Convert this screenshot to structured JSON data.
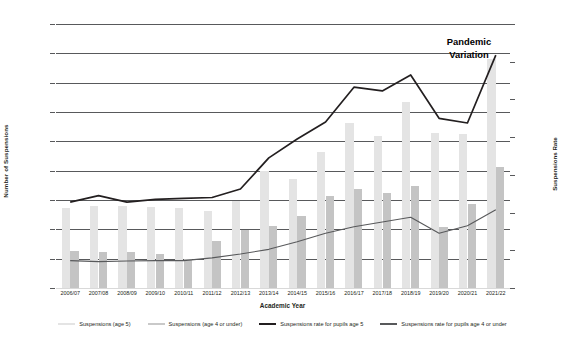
{
  "chart_data": {
    "type": "bar",
    "title": "",
    "xlabel": "Academic Year",
    "ylabel": "Number of Suspensions",
    "ylabel_secondary": "Suspensions Rate",
    "ylim": [
      0,
      9000
    ],
    "ylim_secondary": [
      0.0,
      1.4
    ],
    "ytick_labels": [
      "0",
      "1000",
      "2000",
      "3000",
      "4000",
      "5000",
      "6000",
      "7000",
      "8000",
      "9000"
    ],
    "ytick_values": [
      0,
      1000,
      2000,
      3000,
      4000,
      5000,
      6000,
      7000,
      8000,
      9000
    ],
    "ytick_labels_secondary": [
      "0.000",
      "0.200",
      "0.400",
      "0.600",
      "0.800",
      "1.000",
      "1.200",
      "1.400"
    ],
    "ytick_values_secondary": [
      0.0,
      0.2,
      0.4,
      0.6,
      0.8,
      1.0,
      1.2,
      1.4
    ],
    "grid": true,
    "legend_position": "bottom",
    "categories": [
      "2006/07",
      "2007/08",
      "2008/09",
      "2009/10",
      "2010/11",
      "2011/12",
      "2012/13",
      "2013/14",
      "2014/15",
      "2015/16",
      "2016/17",
      "2017/18",
      "2018/19",
      "2019/20",
      "2020/21",
      "2021/22"
    ],
    "series": [
      {
        "name": "Suspensions (age 5)",
        "type": "bar",
        "axis": "left",
        "color": "#e4e4e4",
        "values": [
          2720,
          2800,
          2810,
          2760,
          2730,
          2640,
          2980,
          4000,
          3730,
          4620,
          5620,
          5170,
          6350,
          5300,
          5250,
          7800
        ]
      },
      {
        "name": "Suspensions (age 4 or under)",
        "type": "bar",
        "axis": "left",
        "color": "#c4c4c4",
        "values": [
          1270,
          1220,
          1220,
          1170,
          1000,
          1600,
          1980,
          2100,
          2440,
          3130,
          3380,
          3240,
          3480,
          2080,
          2880,
          4120
        ]
      },
      {
        "name": "Suspensions rate for pupils age 5",
        "type": "line",
        "axis": "right",
        "color": "#231f20",
        "values": [
          0.455,
          0.49,
          0.455,
          0.47,
          0.475,
          0.48,
          0.525,
          0.69,
          0.79,
          0.88,
          1.065,
          1.045,
          1.13,
          0.9,
          0.875,
          1.235
        ]
      },
      {
        "name": "Suspensions rate for pupils age 4 or under",
        "type": "line",
        "axis": "right",
        "color": "#58595b",
        "values": [
          0.145,
          0.14,
          0.143,
          0.145,
          0.145,
          0.16,
          0.18,
          0.205,
          0.245,
          0.29,
          0.325,
          0.35,
          0.375,
          0.29,
          0.33,
          0.415
        ]
      }
    ],
    "annotations": [
      {
        "text_line1": "Pandemic",
        "text_line2": "Variation",
        "x_category": "2019/20"
      }
    ]
  },
  "legend": {
    "items": [
      {
        "label": "Suspensions (age 5)",
        "swatch": "bar-swatch-light"
      },
      {
        "label": "Suspensions (age 4 or under)",
        "swatch": "bar-swatch-dark"
      },
      {
        "label": "Suspensions rate for pupils age 5",
        "swatch": "line-swatch-black"
      },
      {
        "label": "Suspensions rate for pupils age 4 or under",
        "swatch": "line-swatch-gray"
      }
    ]
  },
  "colors": {
    "bar_age5": "#e4e4e4",
    "bar_age4": "#c4c4c4",
    "line_rate5": "#231f20",
    "line_rate4": "#58595b",
    "gridline": "#58595b",
    "background": "#ffffff"
  }
}
